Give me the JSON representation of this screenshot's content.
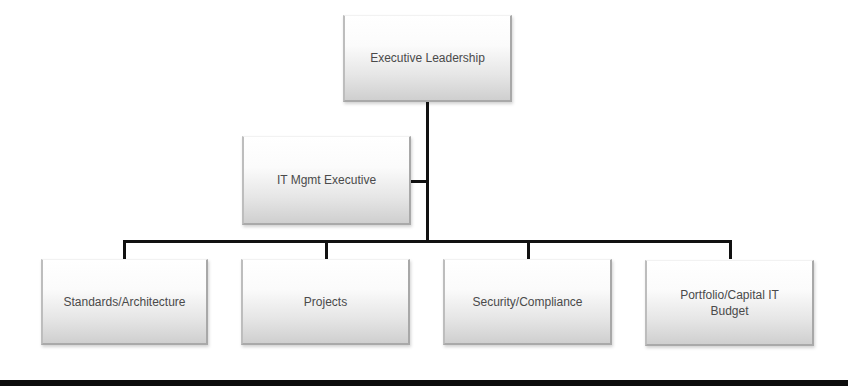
{
  "diagram": {
    "type": "org-chart",
    "nodes": {
      "executive": {
        "label": "Executive Leadership"
      },
      "it_mgmt": {
        "label": "IT Mgmt Executive"
      },
      "children": [
        {
          "label": "Standards/Architecture"
        },
        {
          "label": "Projects"
        },
        {
          "label": "Security/Compliance"
        },
        {
          "label": "Portfolio/Capital IT Budget"
        }
      ]
    },
    "edges": [
      {
        "from": "Executive Leadership",
        "to": "IT Mgmt Executive",
        "type": "assistant"
      },
      {
        "from": "Executive Leadership",
        "to": "Standards/Architecture"
      },
      {
        "from": "Executive Leadership",
        "to": "Projects"
      },
      {
        "from": "Executive Leadership",
        "to": "Security/Compliance"
      },
      {
        "from": "Executive Leadership",
        "to": "Portfolio/Capital IT Budget"
      }
    ],
    "colors": {
      "box_top": "#ffffff",
      "box_bottom": "#cfcfcf",
      "text": "#4a4a4a",
      "connector": "#111111"
    }
  }
}
